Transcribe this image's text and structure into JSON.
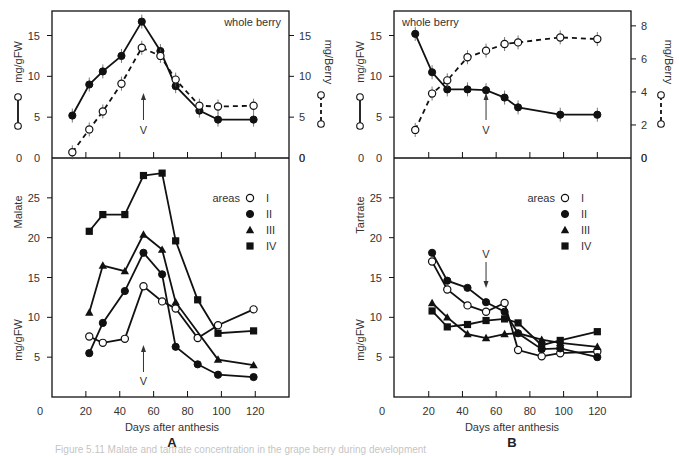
{
  "caption": "Figure 5.11 Malate and tartrate concentration in the grape berry during development",
  "chart_data": [
    {
      "id": "A",
      "panel_label": "A",
      "type": "line",
      "xlabel": "Days after anthesis",
      "x_ticks": [
        0,
        20,
        40,
        60,
        80,
        100,
        120
      ],
      "xlim": [
        0,
        140
      ],
      "top": {
        "title": "whole berry",
        "ylabel_left": "mg/gFW",
        "ylabel_right": "mg/Berry",
        "ylim_left": [
          0,
          18
        ],
        "yticks_left": [
          0,
          5,
          10,
          15
        ],
        "ylim_right": [
          0,
          18
        ],
        "yticks_right": [
          0,
          5,
          10,
          15
        ],
        "veraison_label": "V",
        "veraison_day": 54,
        "series": [
          {
            "name": "mg/gFW",
            "axis": "left",
            "marker": "filled-circle",
            "dash": false,
            "x": [
              12,
              22,
              30,
              41,
              53,
              64,
              73,
              87,
              98,
              119
            ],
            "y": [
              5.2,
              9.0,
              10.6,
              12.5,
              16.7,
              13.1,
              8.8,
              5.8,
              4.7,
              4.7
            ]
          },
          {
            "name": "mg/Berry",
            "axis": "right",
            "marker": "open-circle",
            "dash": true,
            "x": [
              12,
              22,
              30,
              41,
              53,
              64,
              73,
              87,
              98,
              119
            ],
            "y": [
              0.7,
              3.5,
              5.7,
              9.1,
              13.5,
              12.5,
              9.6,
              6.4,
              6.3,
              6.4
            ]
          }
        ]
      },
      "bottom": {
        "ylabel": "Malate",
        "ylabel_unit": "mg/gFW",
        "ylim": [
          0,
          30
        ],
        "yticks": [
          0,
          5,
          10,
          15,
          20,
          25
        ],
        "legend_title": "areas",
        "veraison_label": "V",
        "veraison_day": 54,
        "series": [
          {
            "name": "I",
            "marker": "open-circle",
            "x": [
              22,
              30,
              43,
              54,
              65,
              73,
              86,
              98,
              119
            ],
            "y": [
              7.6,
              6.8,
              7.3,
              13.9,
              12.0,
              11.1,
              7.4,
              9.0,
              11.0
            ]
          },
          {
            "name": "II",
            "marker": "filled-circle",
            "x": [
              22,
              30,
              43,
              54,
              65,
              73,
              86,
              98,
              119
            ],
            "y": [
              5.5,
              9.3,
              13.3,
              18.1,
              15.4,
              6.3,
              4.1,
              2.8,
              2.5
            ]
          },
          {
            "name": "III",
            "marker": "filled-triangle",
            "x": [
              22,
              30,
              43,
              54,
              65,
              73,
              98,
              119
            ],
            "y": [
              10.6,
              16.5,
              15.8,
              20.4,
              18.5,
              11.9,
              4.7,
              4.0
            ]
          },
          {
            "name": "IV",
            "marker": "filled-square",
            "x": [
              22,
              30,
              43,
              54,
              65,
              73,
              86,
              98,
              119
            ],
            "y": [
              20.8,
              22.9,
              22.9,
              27.8,
              28.1,
              19.6,
              12.2,
              8.0,
              8.3
            ]
          }
        ]
      }
    },
    {
      "id": "B",
      "panel_label": "B",
      "type": "line",
      "xlabel": "Days after anthesis",
      "x_ticks": [
        0,
        20,
        40,
        60,
        80,
        100,
        120
      ],
      "xlim": [
        0,
        140
      ],
      "top": {
        "title": "whole berry",
        "ylabel_left": "mg/gFW",
        "ylabel_right": "mg/Berry",
        "ylim_left": [
          0,
          18
        ],
        "yticks_left": [
          0,
          5,
          10,
          15
        ],
        "ylim_right": [
          0,
          8.9
        ],
        "yticks_right": [
          0,
          2,
          4,
          6,
          8
        ],
        "veraison_label": "V",
        "veraison_day": 54,
        "series": [
          {
            "name": "mg/gFW",
            "axis": "left",
            "marker": "filled-circle",
            "dash": false,
            "x": [
              12,
              22,
              31,
              43,
              54,
              65,
              73,
              98,
              120
            ],
            "y": [
              15.2,
              10.5,
              8.4,
              8.4,
              8.3,
              7.4,
              6.2,
              5.3,
              5.3
            ]
          },
          {
            "name": "mg/Berry",
            "axis": "right",
            "marker": "open-circle",
            "dash": true,
            "x": [
              12,
              22,
              31,
              43,
              54,
              65,
              73,
              98,
              120
            ],
            "y": [
              1.7,
              3.9,
              4.7,
              6.1,
              6.5,
              6.9,
              7.0,
              7.3,
              7.2
            ]
          }
        ]
      },
      "bottom": {
        "ylabel": "Tartrate",
        "ylabel_unit": "mg/gFW",
        "ylim": [
          0,
          30
        ],
        "yticks": [
          0,
          5,
          10,
          15,
          20,
          25
        ],
        "legend_title": "areas",
        "veraison_label": "V",
        "veraison_day": 54,
        "series": [
          {
            "name": "I",
            "marker": "open-circle",
            "x": [
              22,
              31,
              43,
              54,
              65,
              73,
              87,
              98,
              120
            ],
            "y": [
              17.0,
              13.5,
              11.5,
              10.7,
              11.8,
              5.9,
              5.1,
              5.5,
              5.7
            ]
          },
          {
            "name": "II",
            "marker": "filled-circle",
            "x": [
              22,
              31,
              43,
              54,
              65,
              73,
              87,
              98,
              120
            ],
            "y": [
              18.1,
              14.6,
              13.7,
              11.9,
              10.7,
              8.0,
              6.0,
              6.1,
              5.0
            ]
          },
          {
            "name": "III",
            "marker": "filled-triangle",
            "x": [
              22,
              31,
              43,
              54,
              65,
              73,
              87,
              98,
              120
            ],
            "y": [
              11.8,
              10.0,
              7.9,
              7.4,
              7.9,
              8.0,
              7.2,
              6.8,
              6.3
            ]
          },
          {
            "name": "IV",
            "marker": "filled-square",
            "x": [
              22,
              31,
              43,
              54,
              65,
              73,
              87,
              98,
              120
            ],
            "y": [
              10.8,
              8.8,
              9.1,
              9.6,
              9.8,
              9.3,
              6.5,
              7.1,
              8.2
            ]
          }
        ]
      }
    }
  ]
}
